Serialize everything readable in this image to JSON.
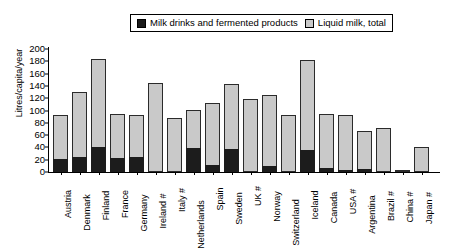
{
  "chart_data": {
    "type": "bar",
    "stacked": true,
    "title": "",
    "xlabel": "",
    "ylabel": "Litres/capita/year",
    "ylim": [
      0,
      200
    ],
    "yticks": [
      200,
      180,
      160,
      140,
      120,
      100,
      80,
      60,
      40,
      20,
      0
    ],
    "grid": false,
    "legend_position": "top",
    "categories": [
      "Austria",
      "Denmark",
      "Finland",
      "France",
      "Germany",
      "Ireland #",
      "Italy #",
      "Netherlands",
      "Spain",
      "Sweden",
      "UK #",
      "Norway",
      "Switzerland",
      "Iceland",
      "Canada",
      "USA #",
      "Argentina",
      "Brazil #",
      "China #",
      "Japan #"
    ],
    "series": [
      {
        "name": "Milk drinks and fermented products",
        "color": "#1c1c1c",
        "values": [
          21,
          24,
          40,
          23,
          25,
          0,
          0,
          39,
          11,
          38,
          0,
          10,
          0,
          35,
          7,
          4,
          5,
          0,
          0,
          0
        ]
      },
      {
        "name": "Liquid milk, total",
        "color": "#c9c9c9",
        "values": [
          93,
          130,
          183,
          94,
          92,
          144,
          88,
          101,
          112,
          143,
          119,
          125,
          93,
          182,
          94,
          92,
          66,
          72,
          3,
          40
        ]
      }
    ]
  },
  "legend": {
    "items": [
      {
        "label": "Milk drinks and fermented products",
        "marker": "dark-square-marker"
      },
      {
        "label": "Liquid milk, total",
        "marker": "light-square-marker"
      }
    ]
  }
}
